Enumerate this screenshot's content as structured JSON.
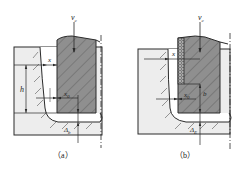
{
  "panels": [
    {
      "id": "a",
      "caption": "（a）",
      "labels": {
        "velocity": "v",
        "velocity_sub": "c",
        "x": "x",
        "x0": "x",
        "x0_sub": "0",
        "h": "h",
        "delta": "Δ",
        "delta_sub": "b"
      }
    },
    {
      "id": "b",
      "caption": "（b）",
      "labels": {
        "velocity": "v",
        "velocity_sub": "c",
        "x": "x",
        "x0": "x",
        "x0_sub": "0",
        "b": "b",
        "delta": "Δ",
        "delta_sub": "E"
      }
    }
  ],
  "colors": {
    "tool": "#8f8f8f",
    "workpiece": "#ededed",
    "line": "#2a2a2a",
    "hatch": "#555555"
  }
}
